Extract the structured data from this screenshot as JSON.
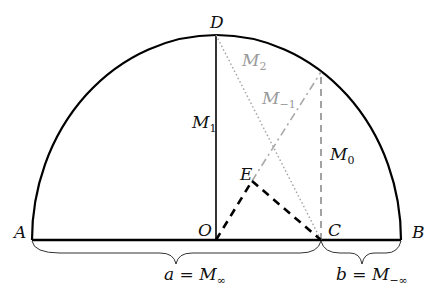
{
  "diagram": {
    "type": "geometry-semicircle-means",
    "points": {
      "A": {
        "label": "A",
        "x": 32,
        "y": 240
      },
      "B": {
        "label": "B",
        "x": 401,
        "y": 240
      },
      "O": {
        "label": "O",
        "x": 216,
        "y": 240
      },
      "C": {
        "label": "C",
        "x": 321,
        "y": 240
      },
      "D": {
        "label": "D",
        "x": 216,
        "y": 35
      },
      "E": {
        "label": "E",
        "x": 252,
        "y": 181
      },
      "T": {
        "x": 321,
        "y": 72
      }
    },
    "segments": {
      "M1": {
        "main": "M",
        "sub": "1",
        "style": "solid",
        "color": "#000000"
      },
      "M0": {
        "main": "M",
        "sub": "0",
        "style": "dashed",
        "color": "#8c8c8c"
      },
      "M2": {
        "main": "M",
        "sub": "2",
        "style": "dotted",
        "color": "#a0a0a0"
      },
      "Mneg1": {
        "main": "M",
        "sub": "−1",
        "style": "dash-dot",
        "color": "#a8a8a8"
      },
      "OE": {
        "style": "bold-dashed",
        "color": "#000000"
      },
      "EC": {
        "style": "bold-dashed",
        "color": "#000000"
      }
    },
    "braces": {
      "a": {
        "lhs": "a",
        "eq": " = ",
        "main": "M",
        "sub": "∞"
      },
      "b": {
        "lhs": "b",
        "eq": " = ",
        "main": "M",
        "sub": "−∞"
      }
    }
  }
}
